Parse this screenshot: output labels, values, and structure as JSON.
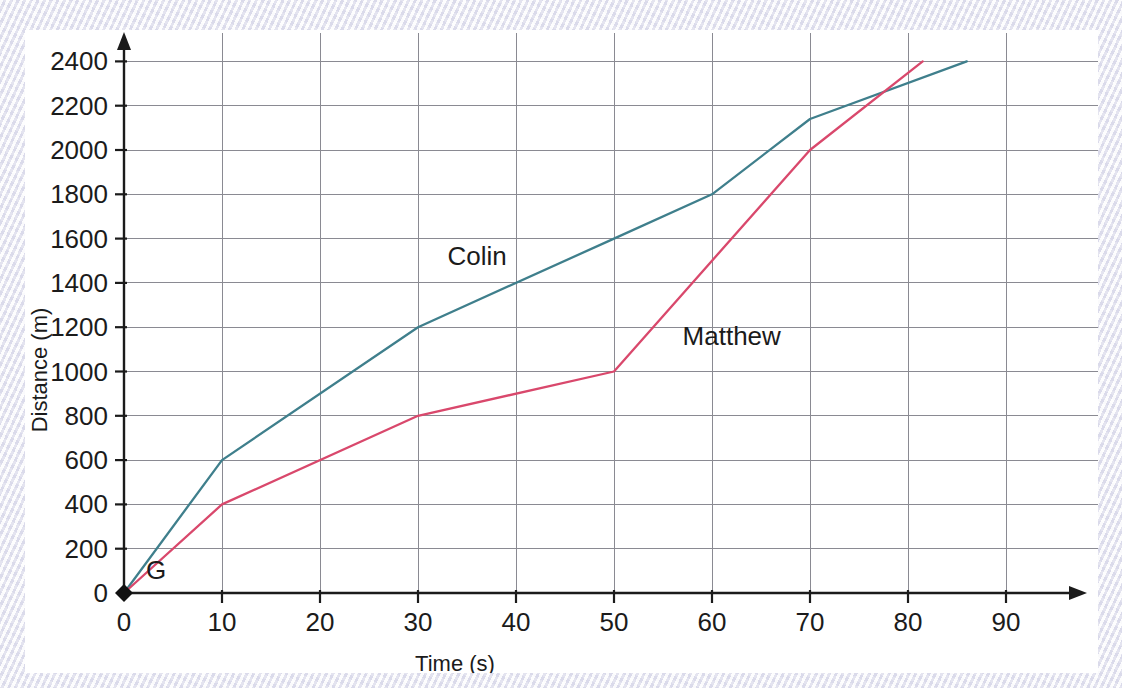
{
  "chart_data": {
    "type": "line",
    "title": "",
    "subtitle": "",
    "xlabel": "Time (s)",
    "ylabel": "Distance (m)",
    "xlim": [
      0,
      100
    ],
    "ylim": [
      0,
      2600
    ],
    "grid": true,
    "legend_position": "inline-annotation",
    "x_ticks": [
      0,
      10,
      20,
      30,
      40,
      50,
      60,
      70,
      80,
      90
    ],
    "x_tick_labels": [
      "0",
      "10",
      "20",
      "30",
      "40",
      "50",
      "60",
      "70",
      "80",
      "90"
    ],
    "y_ticks": [
      0,
      200,
      400,
      600,
      800,
      1000,
      1200,
      1400,
      1600,
      1800,
      2000,
      2200,
      2400
    ],
    "y_tick_labels": [
      "0",
      "200",
      "400",
      "600",
      "800",
      "1000",
      "1200",
      "1400",
      "1600",
      "1800",
      "2000",
      "2200",
      "2400"
    ],
    "series": [
      {
        "name": "Colin",
        "color": "#3f7f8c",
        "label_x": 33,
        "label_y": 1480,
        "points": [
          {
            "x": 0,
            "y": 0
          },
          {
            "x": 10,
            "y": 600
          },
          {
            "x": 30,
            "y": 1200
          },
          {
            "x": 50,
            "y": 1600
          },
          {
            "x": 60,
            "y": 1800
          },
          {
            "x": 70,
            "y": 2140
          },
          {
            "x": 86,
            "y": 2400
          }
        ]
      },
      {
        "name": "Matthew",
        "color": "#d9486c",
        "label_x": 57,
        "label_y": 1120,
        "points": [
          {
            "x": 0,
            "y": 0
          },
          {
            "x": 10,
            "y": 400
          },
          {
            "x": 30,
            "y": 800
          },
          {
            "x": 50,
            "y": 1000
          },
          {
            "x": 70,
            "y": 2000
          },
          {
            "x": 81.5,
            "y": 2400
          }
        ]
      }
    ],
    "annotations": [
      {
        "name": "origin-point",
        "label": "G",
        "x": 0,
        "y": 0,
        "marker": "diamond",
        "marker_color": "#111111",
        "label_dx": 22,
        "label_dy": -14
      }
    ]
  }
}
